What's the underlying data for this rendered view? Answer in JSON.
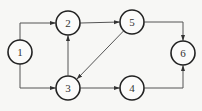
{
  "diagram": {
    "type": "directed-graph",
    "nodes": [
      {
        "id": "1",
        "label": "1",
        "x": 20,
        "y": 52
      },
      {
        "id": "2",
        "label": "2",
        "x": 68,
        "y": 23
      },
      {
        "id": "3",
        "label": "3",
        "x": 68,
        "y": 88
      },
      {
        "id": "4",
        "label": "4",
        "x": 132,
        "y": 88
      },
      {
        "id": "5",
        "label": "5",
        "x": 132,
        "y": 22
      },
      {
        "id": "6",
        "label": "6",
        "x": 183,
        "y": 53
      }
    ],
    "edges": [
      {
        "from": "1",
        "to": "2"
      },
      {
        "from": "1",
        "to": "3"
      },
      {
        "from": "2",
        "to": "5"
      },
      {
        "from": "3",
        "to": "2"
      },
      {
        "from": "5",
        "to": "3"
      },
      {
        "from": "3",
        "to": "4"
      },
      {
        "from": "5",
        "to": "6"
      },
      {
        "from": "4",
        "to": "6"
      }
    ]
  }
}
